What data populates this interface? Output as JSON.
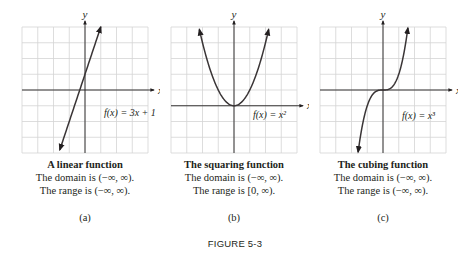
{
  "figure": {
    "label": "FIGURE 5-3"
  },
  "panels": [
    {
      "id": "a",
      "sublabel": "(a)",
      "title": "A linear function",
      "domain_text": "The domain is (−∞, ∞).",
      "range_text": "The range is (−∞, ∞).",
      "equation": "f(x) = 3x + 1",
      "x_axis_label": "x",
      "y_axis_label": "y"
    },
    {
      "id": "b",
      "sublabel": "(b)",
      "title": "The squaring function",
      "domain_text": "The domain is (−∞, ∞).",
      "range_text": "The range is [0, ∞).",
      "equation": "f(x) = x²",
      "x_axis_label": "x",
      "y_axis_label": "y"
    },
    {
      "id": "c",
      "sublabel": "(c)",
      "title": "The cubing function",
      "domain_text": "The domain is (−∞, ∞).",
      "range_text": "The range is (−∞, ∞).",
      "equation": "f(x) = x³",
      "x_axis_label": "x",
      "y_axis_label": "y"
    }
  ],
  "colors": {
    "grid": "#d4d4d4",
    "axis": "#231f20",
    "curve": "#3a3536",
    "text": "#231f20"
  },
  "chart_data": [
    {
      "type": "line",
      "title": "A linear function",
      "function": "f(x) = 3x + 1",
      "xlabel": "x",
      "ylabel": "y",
      "grid": true,
      "xlim": [
        -4,
        4
      ],
      "ylim": [
        -4,
        4
      ],
      "x": [
        -1.6,
        -1.0,
        -0.333,
        0,
        0.5,
        1.0
      ],
      "y": [
        -3.8,
        -2.0,
        0,
        1.0,
        2.5,
        4.0
      ],
      "arrows": "both ends",
      "domain": "(-∞, ∞)",
      "range": "(-∞, ∞)"
    },
    {
      "type": "line",
      "title": "The squaring function",
      "function": "f(x) = x^2",
      "xlabel": "x",
      "ylabel": "y",
      "grid": true,
      "xlim": [
        -4,
        4
      ],
      "ylim": [
        -3,
        5
      ],
      "x": [
        -2.2,
        -2,
        -1.5,
        -1,
        -0.5,
        0,
        0.5,
        1,
        1.5,
        2,
        2.2
      ],
      "y": [
        4.84,
        4,
        2.25,
        1,
        0.25,
        0,
        0.25,
        1,
        2.25,
        4,
        4.84
      ],
      "arrows": "both ends",
      "domain": "(-∞, ∞)",
      "range": "[0, ∞)"
    },
    {
      "type": "line",
      "title": "The cubing function",
      "function": "f(x) = x^3",
      "xlabel": "x",
      "ylabel": "y",
      "grid": true,
      "xlim": [
        -4,
        4
      ],
      "ylim": [
        -4,
        4
      ],
      "x": [
        -1.58,
        -1.5,
        -1,
        -0.5,
        0,
        0.5,
        1,
        1.5,
        1.58
      ],
      "y": [
        -3.94,
        -3.375,
        -1,
        -0.125,
        0,
        0.125,
        1,
        3.375,
        3.94
      ],
      "arrows": "both ends",
      "domain": "(-∞, ∞)",
      "range": "(-∞, ∞)"
    }
  ]
}
